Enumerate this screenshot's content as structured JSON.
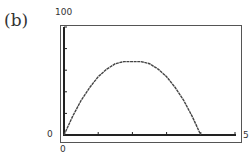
{
  "panel_label": "(b)",
  "axis_labels": {
    "y_max": "100",
    "y_min": "0",
    "x_min": "0",
    "x_max": "5"
  },
  "chart_data": {
    "type": "line",
    "title": "(b)",
    "xlabel": "",
    "ylabel": "",
    "xlim": [
      0,
      5
    ],
    "ylim": [
      0,
      100
    ],
    "x_ticks": [
      0,
      1,
      2,
      3,
      4,
      5
    ],
    "y_ticks": [
      0,
      20,
      40,
      60,
      80,
      100
    ],
    "grid": false,
    "legend": null,
    "series": [
      {
        "name": "curve",
        "x": [
          0,
          0.25,
          0.5,
          0.75,
          1.0,
          1.25,
          1.5,
          1.75,
          2.0,
          2.25,
          2.5,
          2.75,
          3.0,
          3.25,
          3.5,
          3.75,
          4.0
        ],
        "values": [
          0,
          17,
          32,
          44,
          54,
          61,
          66,
          68,
          68,
          68,
          66,
          61,
          54,
          44,
          32,
          17,
          0
        ]
      }
    ]
  },
  "colors": {
    "frame": "#333333",
    "curve": "#444444",
    "background": "#ffffff"
  }
}
